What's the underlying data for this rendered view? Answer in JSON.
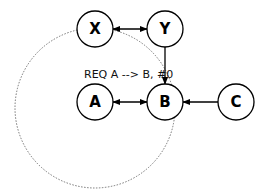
{
  "diagram": {
    "nodes": [
      {
        "id": "X",
        "label": "X"
      },
      {
        "id": "Y",
        "label": "Y"
      },
      {
        "id": "A",
        "label": "A"
      },
      {
        "id": "B",
        "label": "B"
      },
      {
        "id": "C",
        "label": "C"
      }
    ],
    "edges": [
      {
        "from": "X",
        "to": "Y",
        "type": "bidirectional"
      },
      {
        "from": "Y",
        "to": "B",
        "type": "directed"
      },
      {
        "from": "A",
        "to": "B",
        "type": "bidirectional"
      },
      {
        "from": "C",
        "to": "B",
        "type": "directed"
      }
    ],
    "annotation": "REQ A --> B, #0",
    "dotted_circle": {
      "around": "A",
      "through": [
        "X",
        "B"
      ]
    }
  }
}
